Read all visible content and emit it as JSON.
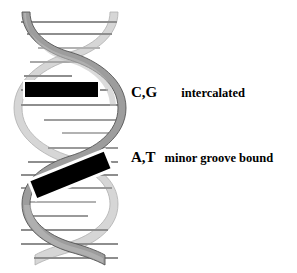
{
  "figure": {
    "background_color": "#ffffff"
  },
  "helix": {
    "front_strand_color": "#9a9a9a",
    "front_strand_edge_color": "#4d4d4d",
    "back_strand_color": "#d2d2d2",
    "back_strand_edge_color": "#a8a8a8",
    "rung_color": "#8c8c8c",
    "rung_light_color": "#b5b5b5",
    "turns": 3
  },
  "ligands": [
    {
      "id": "intercalator",
      "shape": "rectangle",
      "orientation": "horizontal",
      "fill_color": "#000000",
      "outline_color": "#ffffff"
    },
    {
      "id": "minor-groove-binder",
      "shape": "rectangle",
      "orientation": "tilted",
      "rotation_degrees": -22,
      "fill_color": "#000000",
      "outline_color": "#ffffff"
    }
  ],
  "labels": [
    {
      "bases": "C,G",
      "mode": "intercalated"
    },
    {
      "bases": "A,T",
      "mode": "minor groove bound"
    }
  ]
}
